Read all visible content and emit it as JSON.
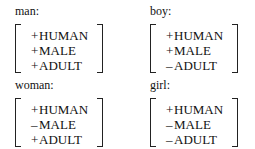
{
  "entries": [
    {
      "word": "man:",
      "features": [
        {
          "sign": "+",
          "name": "HUMAN"
        },
        {
          "sign": "+",
          "name": "MALE"
        },
        {
          "sign": "+",
          "name": "ADULT"
        }
      ]
    },
    {
      "word": "boy:",
      "features": [
        {
          "sign": "+",
          "name": "HUMAN"
        },
        {
          "sign": "+",
          "name": "MALE"
        },
        {
          "sign": "–",
          "name": "ADULT"
        }
      ]
    },
    {
      "word": "woman:",
      "features": [
        {
          "sign": "+",
          "name": "HUMAN"
        },
        {
          "sign": "–",
          "name": "MALE"
        },
        {
          "sign": "+",
          "name": "ADULT"
        }
      ]
    },
    {
      "word": "girl:",
      "features": [
        {
          "sign": "+",
          "name": "HUMAN"
        },
        {
          "sign": "–",
          "name": "MALE"
        },
        {
          "sign": "–",
          "name": "ADULT"
        }
      ]
    }
  ]
}
